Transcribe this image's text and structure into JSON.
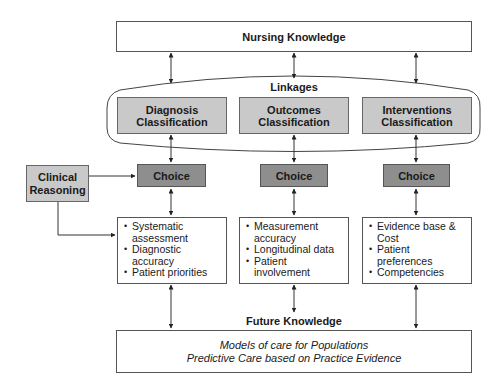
{
  "diagram": {
    "top_box": {
      "label": "Nursing Knowledge"
    },
    "linkages": {
      "label": "Linkages",
      "classifications": [
        {
          "line1": "Diagnosis",
          "line2": "Classification"
        },
        {
          "line1": "Outcomes",
          "line2": "Classification"
        },
        {
          "line1": "Interventions",
          "line2": "Classification"
        }
      ]
    },
    "clinical_reasoning": {
      "line1": "Clinical",
      "line2": "Reasoning"
    },
    "choices": [
      {
        "label": "Choice"
      },
      {
        "label": "Choice"
      },
      {
        "label": "Choice"
      }
    ],
    "detail_boxes": [
      {
        "items": [
          "Systematic assessment",
          "Diagnostic accuracy",
          "Patient priorities"
        ]
      },
      {
        "items": [
          "Measurement accuracy",
          "Longitudinal data",
          "Patient involvement"
        ]
      },
      {
        "items": [
          "Evidence base & Cost",
          "Patient preferences",
          "Competencies"
        ]
      }
    ],
    "future_knowledge": {
      "label": "Future Knowledge",
      "line1": "Models of care for Populations",
      "line2": "Predictive Care based on Practice Evidence"
    },
    "colors": {
      "classification_fill": "#c9c9c9",
      "choice_fill": "#8e8e8e",
      "border": "#555555"
    }
  }
}
